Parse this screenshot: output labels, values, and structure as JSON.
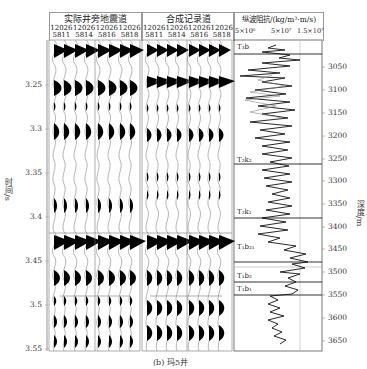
{
  "figure": {
    "caption": "(b) 玛5井",
    "panel_left": {
      "title": "实际井旁地震道",
      "traces": [
        {
          "top": "12026",
          "bottom": "5811"
        },
        {
          "top": "12026",
          "bottom": "5814"
        },
        {
          "top": "12026",
          "bottom": "5816"
        },
        {
          "top": "12026",
          "bottom": "5818"
        }
      ]
    },
    "panel_middle": {
      "title": "合成记录道",
      "traces": [
        {
          "top": "12026",
          "bottom": "5811"
        },
        {
          "top": "12026",
          "bottom": "5814"
        },
        {
          "top": "12026",
          "bottom": "5816"
        },
        {
          "top": "12026",
          "bottom": "5818"
        }
      ]
    },
    "panel_log": {
      "title": "纵波阻抗/(kg/m³·m/s)",
      "scale_ticks": [
        "5×10⁶",
        "5×10⁷",
        "1.5×10⁷"
      ],
      "formations": [
        {
          "label": "T₃b",
          "y": 44
        },
        {
          "label": "T₂k₂",
          "y": 166
        },
        {
          "label": "T₂k₁",
          "y": 211
        },
        {
          "label": "T₁b₂₁",
          "y": 249
        },
        {
          "label": "T₁b₂",
          "y": 281
        },
        {
          "label": "T₁b₁",
          "y": 295
        }
      ]
    },
    "time_axis": {
      "label": "时间/s",
      "ticks": [
        {
          "label": "3.25",
          "y": 85
        },
        {
          "label": "3.3",
          "y": 129
        },
        {
          "label": "3.35",
          "y": 173
        },
        {
          "label": "3.4",
          "y": 217
        },
        {
          "label": "3.45",
          "y": 261
        },
        {
          "label": "3.5",
          "y": 305
        },
        {
          "label": "3.55",
          "y": 349
        }
      ]
    },
    "depth_axis": {
      "label": "深度/m",
      "ticks": [
        {
          "label": "3050",
          "y": 67
        },
        {
          "label": "3100",
          "y": 90
        },
        {
          "label": "3150",
          "y": 113
        },
        {
          "label": "3200",
          "y": 136
        },
        {
          "label": "3250",
          "y": 159
        },
        {
          "label": "3300",
          "y": 181
        },
        {
          "label": "3350",
          "y": 204
        },
        {
          "label": "3400",
          "y": 227
        },
        {
          "label": "3450",
          "y": 249
        },
        {
          "label": "3500",
          "y": 272
        },
        {
          "label": "3550",
          "y": 295
        },
        {
          "label": "3600",
          "y": 318
        },
        {
          "label": "3650",
          "y": 341
        }
      ]
    }
  }
}
